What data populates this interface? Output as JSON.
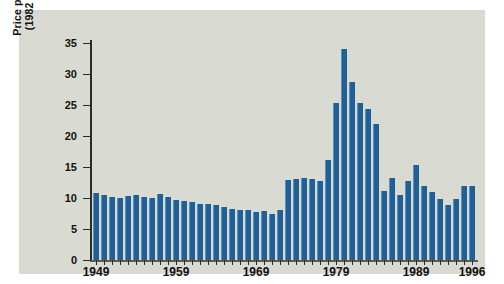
{
  "chart_data": {
    "type": "bar",
    "title": "",
    "xlabel": "",
    "ylabel": "Price per Barrel (1982 dollars)",
    "ylabel_line1": "Price per Barrel",
    "ylabel_line2": "(1982 dollars)",
    "ylim": [
      0,
      35
    ],
    "ytick_values": [
      0,
      5,
      10,
      15,
      20,
      25,
      30,
      35
    ],
    "ytick_labels": [
      "0",
      "5",
      "10",
      "15",
      "20",
      "25",
      "30",
      "35"
    ],
    "xtick_labels": [
      "1949",
      "1959",
      "1969",
      "1979",
      "1989",
      "1996"
    ],
    "grid": false,
    "legend": null,
    "bar_color": "#1f6097",
    "panel_color": "#d9dbd2",
    "categories": [
      "1949",
      "1950",
      "1951",
      "1952",
      "1953",
      "1954",
      "1955",
      "1956",
      "1957",
      "1958",
      "1959",
      "1960",
      "1961",
      "1962",
      "1963",
      "1964",
      "1965",
      "1966",
      "1967",
      "1968",
      "1969",
      "1970",
      "1971",
      "1972",
      "1973",
      "1974",
      "1975",
      "1976",
      "1977",
      "1978",
      "1979",
      "1980",
      "1981",
      "1982",
      "1983",
      "1984",
      "1985",
      "1986",
      "1987",
      "1988",
      "1989",
      "1990",
      "1991",
      "1992",
      "1993",
      "1994",
      "1995",
      "1996"
    ],
    "values": [
      10.8,
      10.5,
      10.1,
      10.0,
      10.4,
      10.5,
      10.2,
      10.0,
      10.7,
      10.2,
      9.7,
      9.5,
      9.4,
      9.1,
      9.0,
      8.8,
      8.5,
      8.3,
      8.0,
      8.0,
      7.7,
      7.9,
      7.5,
      8.1,
      12.9,
      13.1,
      13.2,
      13.0,
      12.7,
      16.2,
      25.4,
      34.0,
      28.7,
      25.4,
      24.3,
      22.0,
      11.1,
      13.3,
      10.5,
      12.7,
      15.4,
      12.0,
      11.0,
      9.9,
      8.8,
      9.8,
      12.0,
      12.0
    ]
  }
}
